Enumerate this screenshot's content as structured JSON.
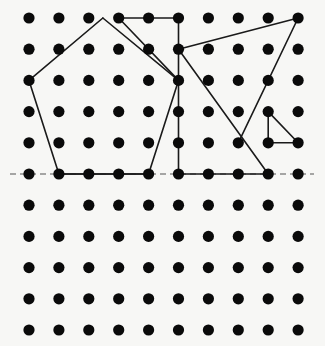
{
  "diagram": {
    "type": "dot-grid-geometry",
    "grid": {
      "columns": 10,
      "rows": 11,
      "origin_x": 29,
      "origin_y": 18,
      "spacing_x": 29.9,
      "spacing_y": 31.2,
      "dot_radius": 5.6,
      "dot_color": "#0a0a0a"
    },
    "line_color": "#1a1a1a",
    "line_width": 1.6,
    "dashed_line": {
      "x1": 10,
      "y1": 174,
      "x2": 314,
      "y2": 174,
      "color": "#555555",
      "dash": "6,4"
    },
    "shapes": [
      {
        "name": "pentagon",
        "points_grid": [
          [
            2.47,
            0
          ],
          [
            5,
            2
          ],
          [
            4,
            5
          ],
          [
            1,
            5
          ],
          [
            0,
            2
          ]
        ],
        "closed": true
      },
      {
        "name": "trapezoid-quad",
        "points_grid": [
          [
            3,
            0
          ],
          [
            5,
            0
          ],
          [
            5,
            5
          ],
          [
            5,
            2
          ]
        ],
        "closed": false,
        "segments_grid": [
          [
            [
              3,
              0
            ],
            [
              5,
              0
            ]
          ],
          [
            [
              3,
              0
            ],
            [
              5,
              2
            ]
          ],
          [
            [
              5,
              0
            ],
            [
              5,
              5
            ]
          ],
          [
            [
              5,
              5
            ],
            [
              8,
              5
            ]
          ]
        ]
      },
      {
        "name": "large-triangle",
        "points_grid": [
          [
            5,
            1
          ],
          [
            9,
            0
          ],
          [
            7,
            4
          ]
        ],
        "closed": false,
        "segments_grid": [
          [
            [
              5,
              1
            ],
            [
              9,
              0
            ]
          ],
          [
            [
              9,
              0
            ],
            [
              7,
              4
            ]
          ]
        ]
      },
      {
        "name": "diagonal-line",
        "segments_grid": [
          [
            [
              5,
              1
            ],
            [
              8,
              5
            ]
          ]
        ]
      },
      {
        "name": "small-right-triangle",
        "points_grid": [
          [
            8,
            3
          ],
          [
            8,
            4
          ],
          [
            9,
            4
          ]
        ],
        "closed": true
      },
      {
        "name": "pentagon-base-extension",
        "segments_grid": [
          [
            [
              1,
              5
            ],
            [
              4,
              5
            ]
          ]
        ]
      }
    ]
  }
}
